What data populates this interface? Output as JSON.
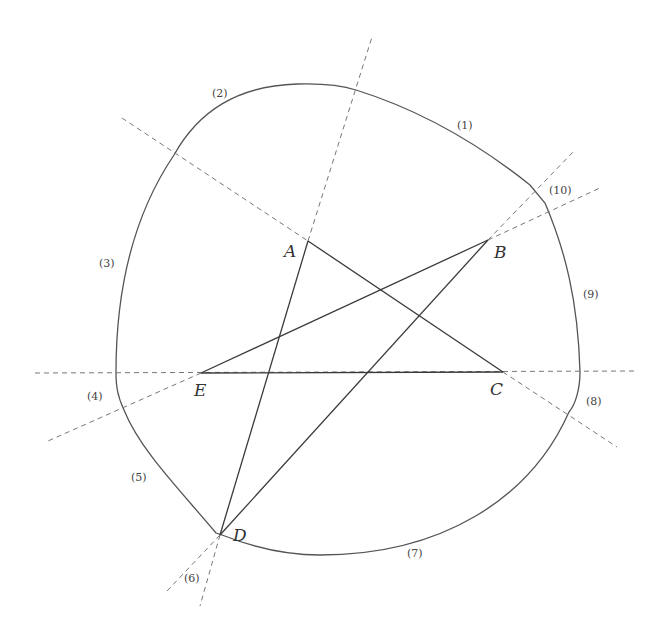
{
  "figure": {
    "type": "geometry-diagram",
    "colors": {
      "curve": "#555555",
      "segments": "#3a3a3a",
      "dashed": "#777777",
      "background": "#ffffff"
    }
  },
  "vertices": [
    {
      "id": "A",
      "label": "A",
      "x": 308,
      "y": 241,
      "label_x": 284,
      "label_y": 257
    },
    {
      "id": "B",
      "label": "B",
      "x": 488,
      "y": 240,
      "label_x": 494,
      "label_y": 258
    },
    {
      "id": "C",
      "label": "C",
      "x": 503,
      "y": 372,
      "label_x": 490,
      "label_y": 394
    },
    {
      "id": "D",
      "label": "D",
      "x": 220,
      "y": 535,
      "label_x": 233,
      "label_y": 540
    },
    {
      "id": "E",
      "label": "E",
      "x": 201,
      "y": 373,
      "label_x": 194,
      "label_y": 395
    }
  ],
  "segments": [
    {
      "from": "A",
      "to": "C"
    },
    {
      "from": "C",
      "to": "E"
    },
    {
      "from": "E",
      "to": "B"
    },
    {
      "from": "B",
      "to": "D"
    },
    {
      "from": "D",
      "to": "A"
    }
  ],
  "arc_labels": [
    {
      "label": "(1)",
      "x": 457,
      "y": 129
    },
    {
      "label": "(2)",
      "x": 212,
      "y": 97
    },
    {
      "label": "(3)",
      "x": 99,
      "y": 265
    },
    {
      "label": "(4)",
      "x": 88,
      "y": 399
    },
    {
      "label": "(5)",
      "x": 131,
      "y": 481
    },
    {
      "label": "(6)",
      "x": 184,
      "y": 581
    },
    {
      "label": "(7)",
      "x": 407,
      "y": 556
    },
    {
      "label": "(8)",
      "x": 586,
      "y": 405
    },
    {
      "label": "(9)",
      "x": 583,
      "y": 297
    },
    {
      "label": "(10)",
      "x": 549,
      "y": 193
    }
  ]
}
